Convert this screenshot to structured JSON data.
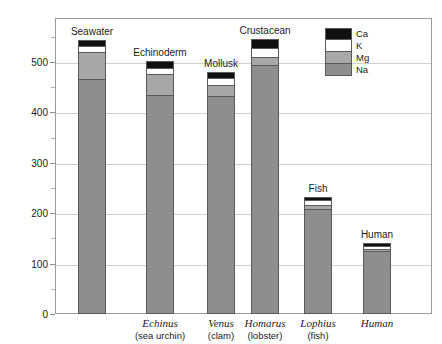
{
  "chart_data": {
    "type": "bar",
    "subtype": "stacked-bar",
    "title": "",
    "xlabel": "",
    "ylabel": "Concentration (mmole/liter)",
    "ylim": [
      0,
      587
    ],
    "yticks": [
      0,
      100,
      200,
      300,
      400,
      500
    ],
    "ytick_labels": [
      "0",
      "100",
      "200",
      "300",
      "400",
      "500"
    ],
    "minor_yticks": [
      50,
      150,
      250,
      350,
      450,
      550
    ],
    "grid": "horizontal",
    "legend_position": "upper-right",
    "categories": [
      "Seawater",
      "Echinus",
      "Venus",
      "Homarus",
      "Lophius",
      "Human"
    ],
    "category_top_labels": [
      "Seawater",
      "Echinoderm",
      "Mollusk",
      "Crustacean",
      "Fish",
      "Human"
    ],
    "category_common_names": [
      "",
      "(sea urchin)",
      "(clam)",
      "(lobster)",
      "(fish)",
      ""
    ],
    "series": [
      {
        "name": "Na",
        "color": "#8e8e8e",
        "values": [
          470,
          440,
          437,
          500,
          214,
          130
        ]
      },
      {
        "name": "Mg",
        "color": "#a8a8a8",
        "values": [
          53,
          40,
          20,
          14,
          5,
          2
        ]
      },
      {
        "name": "K",
        "color": "#ffffff",
        "values": [
          10,
          10,
          12,
          16,
          8,
          5
        ]
      },
      {
        "name": "Ca",
        "color": "#101010",
        "values": [
          11,
          12,
          12,
          16,
          6,
          4
        ]
      }
    ],
    "totals": [
      544,
      502,
      481,
      546,
      233,
      141
    ],
    "legend": [
      {
        "label": "Ca",
        "color": "#101010"
      },
      {
        "label": "K",
        "color": "#ffffff"
      },
      {
        "label": "Mg",
        "color": "#a8a8a8"
      },
      {
        "label": "Na",
        "color": "#8e8e8e"
      }
    ]
  }
}
